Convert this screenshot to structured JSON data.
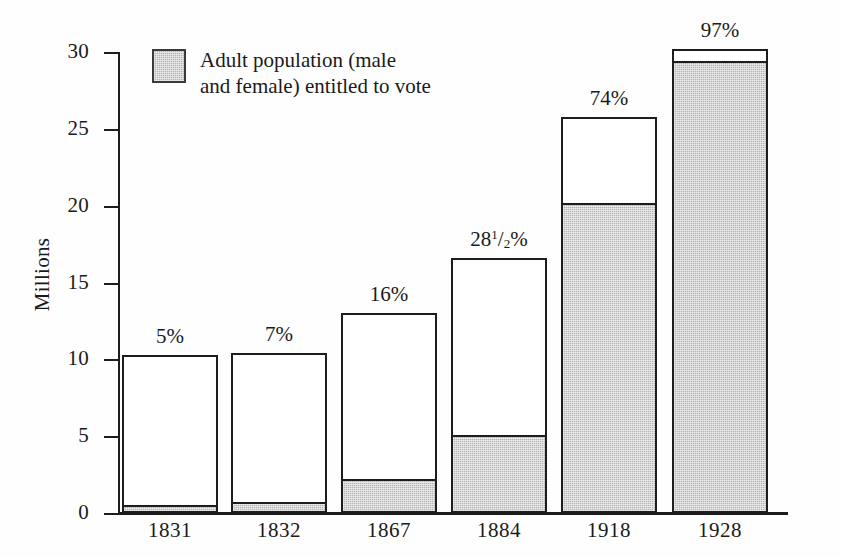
{
  "chart_data": {
    "type": "bar",
    "subtype": "stacked",
    "title": "",
    "xlabel": "",
    "ylabel": "Millions",
    "ylim": [
      0,
      30
    ],
    "yticks": [
      0,
      5,
      10,
      15,
      20,
      25,
      30
    ],
    "ytick_labels": [
      "0",
      "5",
      "10",
      "15",
      "20",
      "25",
      "30"
    ],
    "grid": false,
    "legend": {
      "position": "top-left-inside",
      "entries": [
        {
          "label": "Adult population (male and female) entitled to vote",
          "label_line1": "Adult population (male",
          "label_line2": "and female) entitled to vote",
          "swatch": "shaded-gray",
          "color": "#b4b4b4"
        }
      ]
    },
    "categories": [
      "1831",
      "1832",
      "1867",
      "1884",
      "1918",
      "1928"
    ],
    "series": [
      {
        "name": "Adult population entitled to vote",
        "color": "#b4b4b4",
        "values": [
          0.5,
          0.7,
          2.2,
          5.1,
          20.2,
          29.4
        ]
      },
      {
        "name": "Adult population not entitled to vote",
        "color": "#ffffff",
        "values": [
          9.8,
          9.7,
          10.8,
          11.5,
          5.6,
          0.8
        ]
      }
    ],
    "totals": [
      10.3,
      10.4,
      13.0,
      16.6,
      25.8,
      30.2
    ],
    "annotations": [
      "5%",
      "7%",
      "16%",
      "28¹/₂%",
      "74%",
      "97%"
    ],
    "bars": [
      {
        "category": "1831",
        "total": 10.3,
        "enfranchised": 0.5,
        "percent_label": "5%",
        "percent_value": 5,
        "percent_is_fraction": false
      },
      {
        "category": "1832",
        "total": 10.4,
        "enfranchised": 0.7,
        "percent_label": "7%",
        "percent_value": 7,
        "percent_is_fraction": false
      },
      {
        "category": "1867",
        "total": 13.0,
        "enfranchised": 2.2,
        "percent_label": "16%",
        "percent_value": 16,
        "percent_is_fraction": false
      },
      {
        "category": "1884",
        "total": 16.6,
        "enfranchised": 5.1,
        "percent_label": "28¹/₂%",
        "percent_value": 28.5,
        "percent_is_fraction": true,
        "percent_whole": "28",
        "percent_numerator": "1",
        "percent_denominator": "2",
        "percent_suffix": "%"
      },
      {
        "category": "1918",
        "total": 25.8,
        "enfranchised": 20.2,
        "percent_label": "74%",
        "percent_value": 74,
        "percent_is_fraction": false
      },
      {
        "category": "1928",
        "total": 30.2,
        "enfranchised": 29.4,
        "percent_label": "97%",
        "percent_value": 97,
        "percent_is_fraction": false
      }
    ],
    "colors": {
      "shaded": "#b4b4b4",
      "unshaded": "#ffffff",
      "outline": "#1d1d1d",
      "text": "#1a1a1a"
    }
  }
}
